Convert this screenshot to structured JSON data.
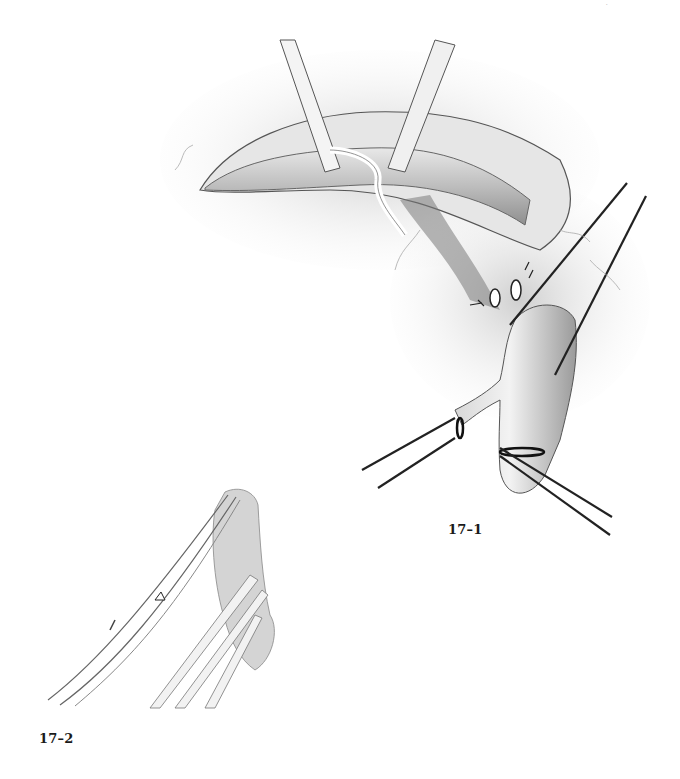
{
  "page": {
    "header_mark": "·"
  },
  "figures": [
    {
      "id": "fig-17-1",
      "label": "17–1",
      "subject": "surgical-illustration-vessel-dissection-with-vessel-loops"
    },
    {
      "id": "fig-17-2",
      "label": "17–2",
      "subject": "surgical-illustration-scissors-and-forceps"
    }
  ],
  "colors": {
    "ink": "#1a1a1a",
    "tissue_shade": "#8a8a8a",
    "tissue_light": "#d9d9d9",
    "background": "#ffffff"
  }
}
